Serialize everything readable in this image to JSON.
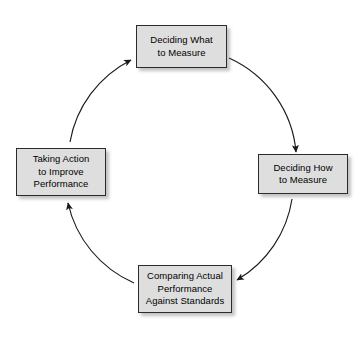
{
  "diagram": {
    "type": "cyclical-flow",
    "direction": "clockwise",
    "background_color": "#ffffff",
    "node_fill_color": "#dedede",
    "node_border_color": "#2b2b2b",
    "arrow_color": "#1a1a1a",
    "nodes": [
      {
        "id": "measure-what",
        "label": "Deciding What\nto Measure",
        "position": "top"
      },
      {
        "id": "measure-how",
        "label": "Deciding How\nto Measure",
        "position": "right"
      },
      {
        "id": "compare",
        "label": "Comparing Actual\nPerformance\nAgainst Standards",
        "position": "bottom"
      },
      {
        "id": "take-action",
        "label": "Taking Action\nto Improve\nPerformance",
        "position": "left"
      }
    ],
    "connectors": [
      {
        "id": "top-to-right",
        "from": "measure-what",
        "to": "measure-how",
        "arrowhead": "end"
      },
      {
        "id": "right-to-bottom",
        "from": "measure-how",
        "to": "compare",
        "arrowhead": "end"
      },
      {
        "id": "bottom-to-left",
        "from": "compare",
        "to": "take-action",
        "arrowhead": "end"
      },
      {
        "id": "left-to-top",
        "from": "take-action",
        "to": "measure-what",
        "arrowhead": "end"
      }
    ]
  }
}
